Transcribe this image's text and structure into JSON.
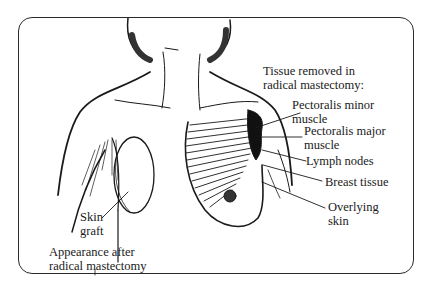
{
  "figure": {
    "title_lines": [
      "Tissue removed in",
      "radical mastectomy:"
    ],
    "labels": {
      "pectoralis_minor": [
        "Pectoralis minor",
        "muscle"
      ],
      "pectoralis_major": [
        "Pectoralis major",
        "muscle"
      ],
      "lymph_nodes": [
        "Lymph nodes"
      ],
      "breast_tissue": [
        "Breast tissue"
      ],
      "overlying_skin": [
        "Overlying",
        "skin"
      ],
      "skin_graft": [
        "Skin",
        "graft"
      ],
      "appearance_after": [
        "Appearance after",
        "radical mastectomy"
      ]
    },
    "colors": {
      "ink": "#1a1a1a",
      "background": "#ffffff",
      "frame": "#2a2a2a"
    }
  }
}
